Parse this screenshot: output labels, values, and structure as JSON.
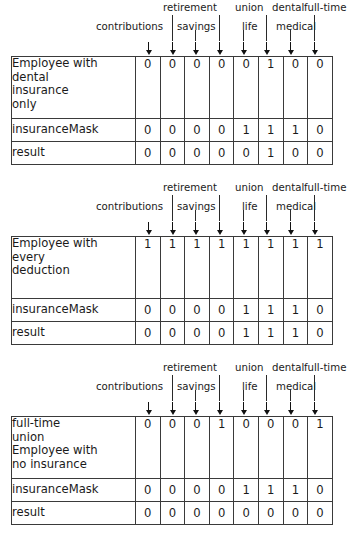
{
  "figure": {
    "column_headers_top": [
      "retirement",
      "union",
      "dental",
      "full-time"
    ],
    "column_headers_bottom": [
      "contributions",
      "savings",
      "life",
      "medical"
    ],
    "columns": [
      "contributions",
      "retirement",
      "savings",
      "union",
      "life",
      "dental",
      "medical",
      "full-time"
    ],
    "arrow_icon": "down-arrow-icon",
    "bit_count": 8
  },
  "blocks": [
    {
      "id": "block-1",
      "headers_top": [
        {
          "text": "retirement",
          "x": 163,
          "y": 2
        },
        {
          "text": "union",
          "x": 235,
          "y": 2
        },
        {
          "text": "dental",
          "x": 272,
          "y": 2
        },
        {
          "text": "full-time",
          "x": 304,
          "y": 2
        }
      ],
      "headers_bottom": [
        {
          "text": "contributions",
          "x": 96,
          "y": 21
        },
        {
          "text": "savings",
          "x": 177,
          "y": 21
        },
        {
          "text": "life",
          "x": 242,
          "y": 21
        },
        {
          "text": "medical",
          "x": 276,
          "y": 21
        }
      ],
      "rows": [
        {
          "label_lines": [
            "Employee with",
            "dental",
            "insurance",
            "only"
          ],
          "label": "Employee with dental insurance only",
          "bits": [
            "0",
            "0",
            "0",
            "0",
            "0",
            "1",
            "0",
            "0"
          ],
          "height": "tall"
        },
        {
          "label_lines": [
            "insuranceMask"
          ],
          "label": "insuranceMask",
          "bits": [
            "0",
            "0",
            "0",
            "0",
            "1",
            "1",
            "1",
            "0"
          ],
          "height": "short"
        },
        {
          "label_lines": [
            "result"
          ],
          "label": "result",
          "bits": [
            "0",
            "0",
            "0",
            "0",
            "0",
            "1",
            "0",
            "0"
          ],
          "height": "short"
        }
      ]
    },
    {
      "id": "block-2",
      "headers_top": [
        {
          "text": "retirement",
          "x": 163,
          "y": 2
        },
        {
          "text": "union",
          "x": 235,
          "y": 2
        },
        {
          "text": "dental",
          "x": 272,
          "y": 2
        },
        {
          "text": "full-time",
          "x": 304,
          "y": 2
        }
      ],
      "headers_bottom": [
        {
          "text": "contributions",
          "x": 96,
          "y": 21
        },
        {
          "text": "savings",
          "x": 177,
          "y": 21
        },
        {
          "text": "life",
          "x": 242,
          "y": 21
        },
        {
          "text": "medical",
          "x": 276,
          "y": 21
        }
      ],
      "rows": [
        {
          "label_lines": [
            "Employee with",
            "every",
            "deduction"
          ],
          "label": "Employee with every deduction",
          "bits": [
            "1",
            "1",
            "1",
            "1",
            "1",
            "1",
            "1",
            "1"
          ],
          "height": "tall"
        },
        {
          "label_lines": [
            "insuranceMask"
          ],
          "label": "insuranceMask",
          "bits": [
            "0",
            "0",
            "0",
            "0",
            "1",
            "1",
            "1",
            "0"
          ],
          "height": "short"
        },
        {
          "label_lines": [
            "result"
          ],
          "label": "result",
          "bits": [
            "0",
            "0",
            "0",
            "0",
            "1",
            "1",
            "1",
            "0"
          ],
          "height": "short"
        }
      ]
    },
    {
      "id": "block-3",
      "headers_top": [
        {
          "text": "retirement",
          "x": 163,
          "y": 2
        },
        {
          "text": "union",
          "x": 235,
          "y": 2
        },
        {
          "text": "dental",
          "x": 272,
          "y": 2
        },
        {
          "text": "full-time",
          "x": 304,
          "y": 2
        }
      ],
      "headers_bottom": [
        {
          "text": "contributions",
          "x": 96,
          "y": 21
        },
        {
          "text": "savings",
          "x": 177,
          "y": 21
        },
        {
          "text": "life",
          "x": 242,
          "y": 21
        },
        {
          "text": "medical",
          "x": 276,
          "y": 21
        }
      ],
      "rows": [
        {
          "label_lines": [
            "full-time",
            "union",
            "Employee with",
            "no insurance"
          ],
          "label": "full-time union Employee with no insurance",
          "bits": [
            "0",
            "0",
            "0",
            "1",
            "0",
            "0",
            "0",
            "1"
          ],
          "height": "tall"
        },
        {
          "label_lines": [
            "insuranceMask"
          ],
          "label": "insuranceMask",
          "bits": [
            "0",
            "0",
            "0",
            "0",
            "1",
            "1",
            "1",
            "0"
          ],
          "height": "short"
        },
        {
          "label_lines": [
            "result"
          ],
          "label": "result",
          "bits": [
            "0",
            "0",
            "0",
            "0",
            "0",
            "0",
            "0",
            "0"
          ],
          "height": "short"
        }
      ]
    }
  ],
  "geometry": {
    "table_left": 11,
    "table_right": 323,
    "label_width": 123,
    "bit_width": 23.6,
    "arrow_xs": [
      145,
      169,
      192,
      216,
      240,
      263,
      287,
      311
    ],
    "block_tops": [
      0,
      180,
      360
    ]
  },
  "colors": {
    "background": "#ffffff",
    "text": "#1a1a1a",
    "border": "#3a3a3a",
    "arrow": "#111111"
  }
}
